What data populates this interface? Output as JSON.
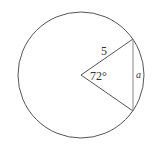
{
  "diagram": {
    "type": "circle-sector-chord",
    "colors": {
      "stroke": "#555555",
      "chord": "#888888",
      "text": "#333333",
      "background": "#ffffff"
    },
    "labels": {
      "radius": "5",
      "angle": "72°",
      "chord": "a"
    }
  }
}
